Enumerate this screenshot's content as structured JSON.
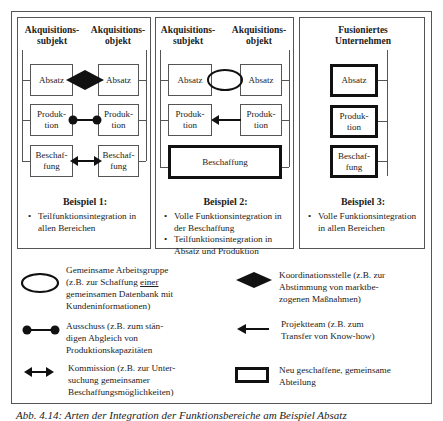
{
  "diagram": {
    "panels": [
      {
        "left_header": "Akquisitions-\nsubjekt",
        "right_header": "Akquisitions-\nobjekt",
        "left_boxes": [
          "Absatz",
          "Produk-\ntion",
          "Beschaf-\nfung"
        ],
        "right_boxes": [
          "Absatz",
          "Produk-\ntion",
          "Beschaf-\nfung"
        ],
        "connectors": [
          "Koordinationsstelle (diamond)",
          "Ausschuss (dumbbell)",
          "Kommission (double arrow)"
        ],
        "example_title": "Beispiel 1:",
        "bullets": [
          "Teilfunktionsintegration in allen Bereichen"
        ]
      },
      {
        "left_header": "Akquisitions-\nsubjekt",
        "right_header": "Akquisitions-\nobjekt",
        "left_boxes": [
          "Absatz",
          "Produk-\ntion"
        ],
        "right_boxes": [
          "Absatz",
          "Produk-\ntion"
        ],
        "joint_box": "Beschaffung",
        "connectors": [
          "Gemeinsame Arbeitsgruppe (ellipse)",
          "Projektteam (arrow)"
        ],
        "example_title": "Beispiel 2:",
        "bullets": [
          "Volle Funktionsintegration in der Beschaffung",
          "Teilfunktionsintegration in Absatz und Produktion"
        ]
      },
      {
        "header": "Fusioniertes\nUnternehmen",
        "boxes": [
          "Absatz",
          "Produk-\ntion",
          "Beschaf-\nfung"
        ],
        "example_title": "Beispiel 3:",
        "bullets": [
          "Volle Funktionsintegration in allen Bereichen"
        ]
      }
    ],
    "legend": [
      {
        "icon": "ellipse-icon",
        "text_pre": "Gemeinsame Arbeitsgruppe\n(z.B. zur Schaffung ",
        "text_u": "einer",
        "text_post": "\ngemeinsamen Datenbank mit\nKundeninformationen)"
      },
      {
        "icon": "dumbbell-icon",
        "text": "Ausschuss (z.B. zum stän-\ndigen Abgleich von\nProduktionskapazitäten"
      },
      {
        "icon": "double-arrow-icon",
        "text": "Kommission (z.B. zur Unter-\nsuchung gemeinsamer\nBeschaffungsmöglichkeiten)"
      },
      {
        "icon": "diamond-icon",
        "text": "Koordinationsstelle (z.B. zur\nAbstimmung von marktbe-\nzogenen Maßnahmen)"
      },
      {
        "icon": "left-arrow-icon",
        "text": "Projektteam (z.B. zum\nTransfer von Know-how)"
      },
      {
        "icon": "thick-box-icon",
        "text": "Neu geschaffene, gemeinsame\nAbteilung"
      }
    ],
    "caption": "Abb. 4.14: Arten der Integration der Funktionsbereiche am Beispiel Absatz"
  }
}
